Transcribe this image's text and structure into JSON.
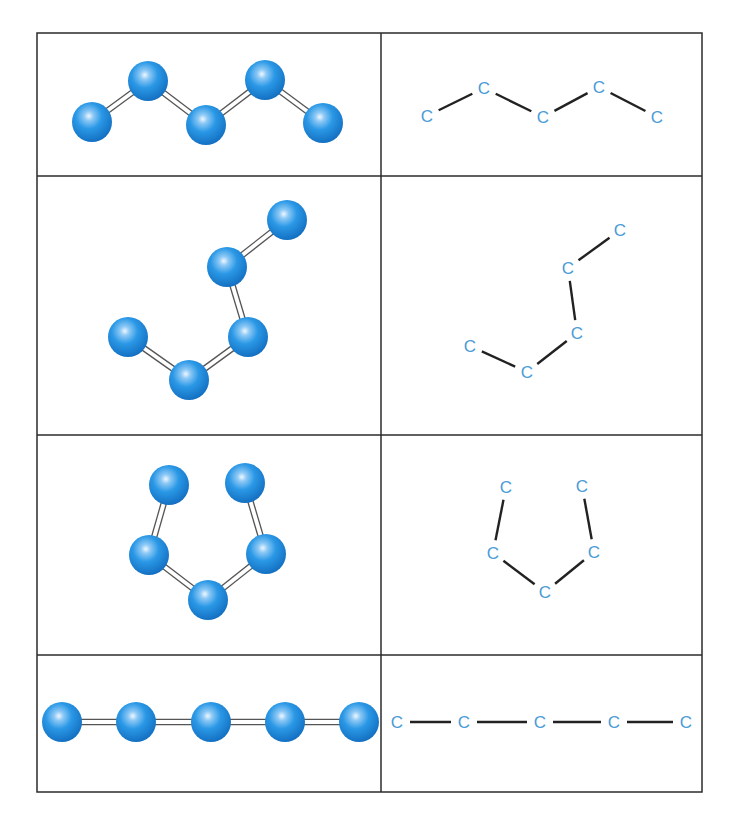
{
  "figure": {
    "grid": {
      "left": 37,
      "right": 702,
      "top": 33,
      "bottom": 792,
      "divider_x": 381,
      "row_lines": [
        176,
        435,
        655
      ],
      "line_color": "#2b2b2b"
    },
    "colors": {
      "atom": "#1e8fe0",
      "atom_dark": "#1570c0",
      "atom_highlight": "#e8f4ff",
      "label": "#4a9bd6",
      "bond_single": "#222222",
      "bond_double": "#555555"
    },
    "atom_radius": 20,
    "atom_label": "C",
    "rows": [
      {
        "name": "zigzag-chain",
        "models": [
          [
            92,
            122
          ],
          [
            148,
            81
          ],
          [
            206,
            125
          ],
          [
            265,
            80
          ],
          [
            323,
            123
          ]
        ],
        "labels": [
          [
            427,
            116
          ],
          [
            484,
            88
          ],
          [
            543,
            117
          ],
          [
            599,
            87
          ],
          [
            657,
            117
          ]
        ]
      },
      {
        "name": "bent-chain",
        "models": [
          [
            128,
            337
          ],
          [
            189,
            380
          ],
          [
            248,
            337
          ],
          [
            227,
            267
          ],
          [
            287,
            220
          ]
        ],
        "labels": [
          [
            470,
            346
          ],
          [
            527,
            372
          ],
          [
            577,
            333
          ],
          [
            568,
            268
          ],
          [
            620,
            230
          ]
        ]
      },
      {
        "name": "ring-like-chain",
        "models": [
          [
            169,
            485
          ],
          [
            149,
            555
          ],
          [
            208,
            600
          ],
          [
            266,
            554
          ],
          [
            245,
            483
          ]
        ],
        "labels": [
          [
            506,
            487
          ],
          [
            493,
            553
          ],
          [
            545,
            592
          ],
          [
            594,
            552
          ],
          [
            582,
            486
          ]
        ]
      },
      {
        "name": "linear-chain",
        "models": [
          [
            62,
            722
          ],
          [
            136,
            722
          ],
          [
            211,
            722
          ],
          [
            285,
            722
          ],
          [
            359,
            722
          ]
        ],
        "labels": [
          [
            397,
            722
          ],
          [
            464,
            722
          ],
          [
            540,
            722
          ],
          [
            614,
            722
          ],
          [
            686,
            722
          ]
        ]
      }
    ]
  }
}
